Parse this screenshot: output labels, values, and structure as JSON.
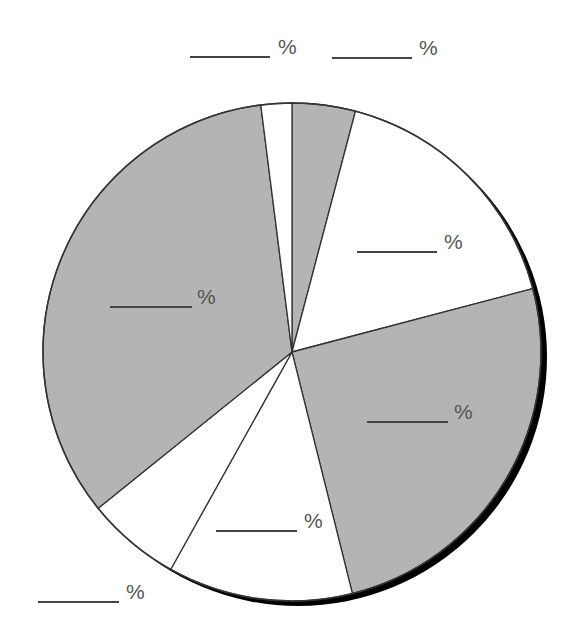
{
  "chart_data": {
    "type": "pie",
    "title": "",
    "start_angle_deg": 0,
    "direction": "clockwise",
    "slices": [
      {
        "label": "______ %",
        "value": 4.1,
        "fill": "#b4b4b4"
      },
      {
        "label": "______ %",
        "value": 16.8,
        "fill": "#ffffff"
      },
      {
        "label": "______ %",
        "value": 25.2,
        "fill": "#b4b4b4"
      },
      {
        "label": "______ %",
        "value": 12.0,
        "fill": "#ffffff"
      },
      {
        "label": "______ %",
        "value": 6.1,
        "fill": "#ffffff"
      },
      {
        "label": "______ %",
        "value": 33.8,
        "fill": "#b4b4b4"
      },
      {
        "label": "______ %",
        "value": 2.0,
        "fill": "#ffffff"
      }
    ],
    "labels_are_blank_fill_ins": true,
    "legend": null
  },
  "labels": [
    {
      "symbol": "%",
      "x1": 190,
      "x2": 270,
      "y": 57,
      "tx": 278,
      "ty": 54
    },
    {
      "symbol": "%",
      "x1": 332,
      "x2": 412,
      "y": 58,
      "tx": 419,
      "ty": 55
    },
    {
      "symbol": "%",
      "x1": 357,
      "x2": 437,
      "y": 252,
      "tx": 444,
      "ty": 249
    },
    {
      "symbol": "%",
      "x1": 110,
      "x2": 192,
      "y": 307,
      "tx": 197,
      "ty": 304
    },
    {
      "symbol": "%",
      "x1": 367,
      "x2": 448,
      "y": 422,
      "tx": 454,
      "ty": 419
    },
    {
      "symbol": "%",
      "x1": 216,
      "x2": 297,
      "y": 531,
      "tx": 304,
      "ty": 528
    },
    {
      "symbol": "%",
      "x1": 38,
      "x2": 119,
      "y": 602,
      "tx": 126,
      "ty": 599
    }
  ],
  "colors": {
    "shaded": "#b4b4b4",
    "unshaded": "#ffffff",
    "outline": "#333333",
    "shadow": "#000000"
  }
}
